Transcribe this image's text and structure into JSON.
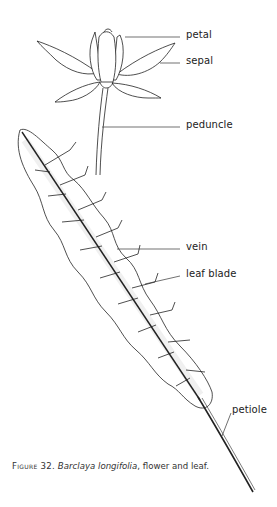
{
  "figure": {
    "labels": {
      "petal": "petal",
      "sepal": "sepal",
      "peduncle": "peduncle",
      "vein": "vein",
      "leaf_blade": "leaf blade",
      "petiole": "petiole"
    },
    "caption": {
      "prefix": "Figure 32.",
      "species": "Barclaya longifolia",
      "suffix": ", flower and leaf."
    },
    "colors": {
      "ink": "#222222",
      "background": "#ffffff"
    }
  }
}
